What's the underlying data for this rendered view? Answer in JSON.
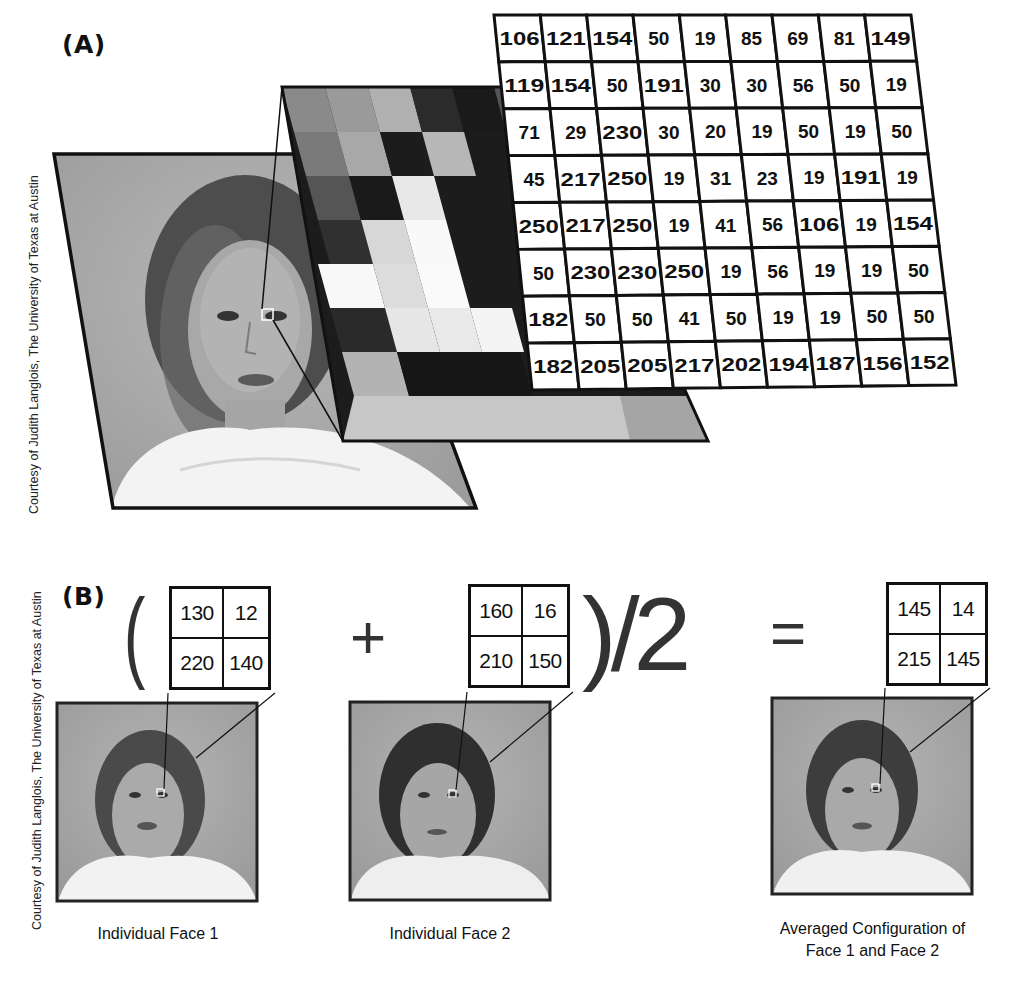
{
  "panel_a": {
    "label": "(A)",
    "credit": "Courtesy of Judith Langlois, The University of Texas at Austin",
    "pixel_grid": {
      "rows": [
        [
          106,
          121,
          154,
          50,
          19,
          85,
          69,
          81,
          149
        ],
        [
          119,
          154,
          50,
          191,
          30,
          30,
          56,
          50,
          19
        ],
        [
          71,
          29,
          230,
          30,
          20,
          19,
          50,
          19,
          50
        ],
        [
          45,
          217,
          250,
          19,
          31,
          23,
          19,
          191,
          19
        ],
        [
          250,
          217,
          250,
          19,
          41,
          56,
          106,
          19,
          154
        ],
        [
          50,
          230,
          230,
          250,
          19,
          56,
          19,
          19,
          50
        ],
        [
          182,
          50,
          50,
          41,
          50,
          19,
          19,
          50,
          50
        ],
        [
          182,
          205,
          205,
          217,
          202,
          194,
          187,
          156,
          152
        ]
      ]
    },
    "mosaic_description": "Zoomed grayscale pixel block of the eye region"
  },
  "panel_b": {
    "label": "(B)",
    "credit": "Courtesy of Judith Langlois, The University of Texas at Austin",
    "operators": {
      "open_paren": "(",
      "plus": "+",
      "close_divide": ")/2",
      "equals": "="
    },
    "faces": [
      {
        "caption_line1": "Individual Face 1",
        "caption_line2": "",
        "grid": [
          [
            "130",
            "12"
          ],
          [
            "220",
            "140"
          ]
        ]
      },
      {
        "caption_line1": "Individual Face 2",
        "caption_line2": "",
        "grid": [
          [
            "160",
            "16"
          ],
          [
            "210",
            "150"
          ]
        ]
      },
      {
        "caption_line1": "Averaged Configuration of",
        "caption_line2": "Face 1 and Face 2",
        "grid": [
          [
            "145",
            "14"
          ],
          [
            "215",
            "145"
          ]
        ]
      }
    ]
  }
}
